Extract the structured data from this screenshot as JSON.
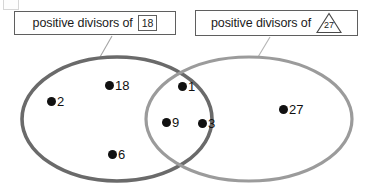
{
  "diagram": {
    "type": "venn-diagram",
    "sets": [
      {
        "id": "left",
        "label_prefix": "positive divisors of",
        "label_value": "18",
        "value_style": "boxed",
        "stroke_color": "#6a6a6a",
        "members_only": [
          "2",
          "18",
          "6"
        ]
      },
      {
        "id": "right",
        "label_prefix": "positive divisors of",
        "label_value": "27",
        "value_style": "triangle",
        "stroke_color": "#9b9b9b",
        "members_only": [
          "27"
        ]
      }
    ],
    "intersection_members": [
      "1",
      "9",
      "3"
    ],
    "points": [
      {
        "label": "2",
        "region": "left-only",
        "x": 47,
        "y": 97
      },
      {
        "label": "18",
        "region": "left-only",
        "x": 105,
        "y": 81
      },
      {
        "label": "6",
        "region": "left-only",
        "x": 108,
        "y": 150
      },
      {
        "label": "1",
        "region": "intersection",
        "x": 178,
        "y": 82
      },
      {
        "label": "9",
        "region": "intersection",
        "x": 162,
        "y": 118
      },
      {
        "label": "3",
        "region": "intersection",
        "x": 198,
        "y": 119
      },
      {
        "label": "27",
        "region": "right-only",
        "x": 279,
        "y": 105
      }
    ],
    "colors": {
      "left_ellipse": "#6a6a6a",
      "right_ellipse": "#9b9b9b",
      "point_fill": "#111111",
      "text": "#1b1b1b",
      "label_border": "#5f5f5f",
      "leader_line": "#9e9e9e",
      "background": "#ffffff"
    }
  }
}
